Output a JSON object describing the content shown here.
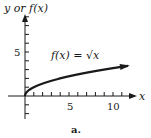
{
  "figure": {
    "y_axis_label": "y or f(x)",
    "x_axis_label": "x",
    "function_label": "f(x) = √x",
    "caption": "a.",
    "tick_labels": {
      "x5": "5",
      "x10": "10",
      "y5": "5"
    }
  },
  "colors": {
    "ink": "#1a1a1a",
    "background": "#ffffff"
  },
  "chart_data": {
    "type": "line",
    "title": "",
    "xlabel": "x",
    "ylabel": "y or f(x)",
    "series": [
      {
        "name": "f(x) = √x",
        "x": [
          0,
          0.25,
          1,
          2,
          3,
          4,
          5,
          6,
          7,
          8,
          9,
          10,
          11.7
        ],
        "values": [
          0,
          0.5,
          1,
          1.414,
          1.732,
          2,
          2.236,
          2.449,
          2.646,
          2.828,
          3,
          3.162,
          3.42
        ]
      }
    ],
    "x_ticks": [
      1,
      2,
      3,
      4,
      5,
      6,
      7,
      8,
      9,
      10,
      11
    ],
    "x_tick_labels": {
      "5": "5",
      "10": "10"
    },
    "y_ticks": [
      -2,
      -1,
      1,
      2,
      3,
      4,
      5,
      6,
      7,
      8,
      9
    ],
    "y_tick_labels": {
      "5": "5"
    },
    "xlim": [
      -2,
      12.5
    ],
    "ylim": [
      -2.5,
      9.5
    ],
    "grid": false,
    "annotations": [
      "f(x) = √x",
      "a."
    ]
  }
}
